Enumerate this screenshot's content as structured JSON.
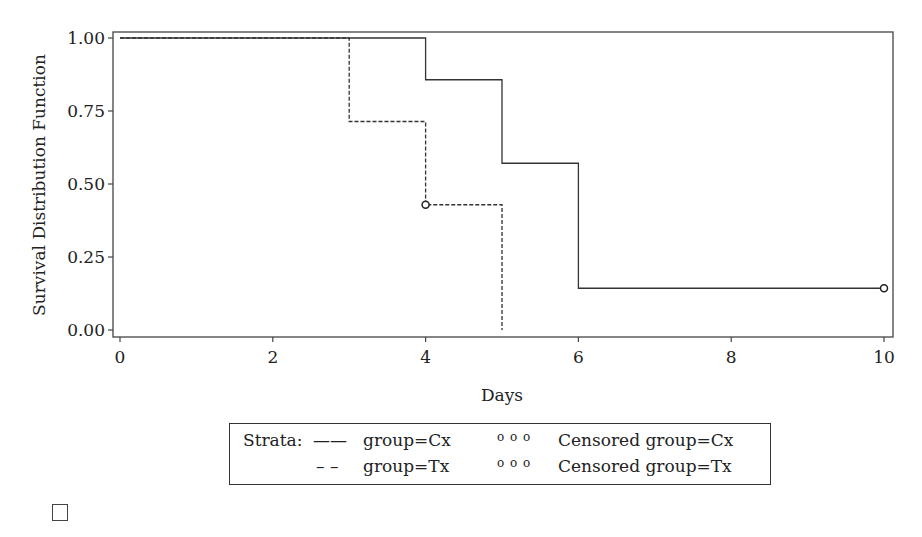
{
  "chart_data": {
    "type": "line",
    "subtype": "kaplan-meier step",
    "title": "",
    "xlabel": "Days",
    "ylabel": "Survival Distribution Function",
    "xlim": [
      0,
      10
    ],
    "ylim": [
      0,
      1
    ],
    "x_ticks": [
      "0",
      "2",
      "4",
      "6",
      "8",
      "10"
    ],
    "y_ticks": [
      "0.00",
      "0.25",
      "0.50",
      "0.75",
      "1.00"
    ],
    "grid": false,
    "legend_position": "bottom",
    "series": [
      {
        "name": "group=Cx",
        "style": "solid",
        "steps": [
          [
            0,
            1.0
          ],
          [
            4,
            0.857
          ],
          [
            5,
            0.571
          ],
          [
            6,
            0.143
          ],
          [
            10,
            0.143
          ]
        ],
        "censored": [
          [
            10,
            0.143
          ]
        ]
      },
      {
        "name": "group=Tx",
        "style": "dashed",
        "steps": [
          [
            0,
            1.0
          ],
          [
            3,
            0.714
          ],
          [
            4,
            0.429
          ],
          [
            5,
            0.0
          ]
        ],
        "censored": [
          [
            4,
            0.429
          ]
        ]
      }
    ]
  },
  "legend": {
    "title": "Strata:",
    "items": [
      {
        "symbol": "——",
        "label": "group=Cx",
        "censor_symbol": "o o o",
        "censor_label": "Censored group=Cx"
      },
      {
        "symbol": "– –",
        "label": "group=Tx",
        "censor_symbol": "o o o",
        "censor_label": "Censored group=Tx"
      }
    ]
  }
}
